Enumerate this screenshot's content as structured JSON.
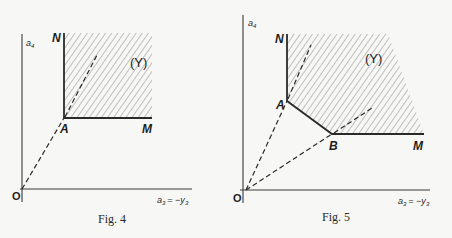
{
  "figures": [
    {
      "caption": "Fig. 4",
      "y_axis_label": "a",
      "y_axis_sub": "4",
      "x_axis_label": "a",
      "x_axis_sub": "3",
      "x_axis_eq": "= −y",
      "x_axis_eq_sub": "3",
      "origin_label": "O",
      "points": {
        "N": "N",
        "A": "A",
        "M": "M"
      },
      "region_label": "(Y)"
    },
    {
      "caption": "Fig. 5",
      "y_axis_label": "a",
      "y_axis_sub": "4",
      "x_axis_label": "a",
      "x_axis_sub": "3",
      "x_axis_eq": "= −y",
      "x_axis_eq_sub": "3",
      "origin_label": "O",
      "points": {
        "N": "N",
        "A": "A",
        "B": "B",
        "M": "M"
      },
      "region_label": "(Y)"
    }
  ]
}
